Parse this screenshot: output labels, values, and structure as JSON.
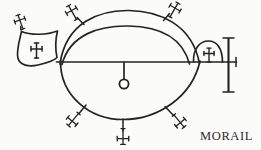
{
  "figure": {
    "caption": "MORAIL",
    "ink_color": "#232323",
    "background_color": "#fbfbf9",
    "parts": {
      "upper_outer_arc": "upper-outer-arc",
      "upper_inner_arc": "upper-inner-arc",
      "lower_arc": "lower-arc",
      "horizontal_beam": "horizontal-beam",
      "pendant_stem": "pendant-stem",
      "pendant_ring": "pendant-ring",
      "left_banner": "left-banner-shield",
      "right_arch": "right-arch",
      "right_mast": "right-mast-bar",
      "right_yard": "right-yard-arm"
    },
    "crosses": [
      {
        "id": "cross-banner-top",
        "position": "banner-top-left",
        "rotation": -20
      },
      {
        "id": "cross-banner-inner",
        "position": "inside-left-banner",
        "rotation": 0
      },
      {
        "id": "cross-upper-left",
        "position": "upper-arc-left",
        "rotation": -30
      },
      {
        "id": "cross-upper-right",
        "position": "upper-arc-right",
        "rotation": 30
      },
      {
        "id": "cross-lower-left",
        "position": "lower-arc-left",
        "rotation": -135
      },
      {
        "id": "cross-lower-center",
        "position": "lower-arc-bottom",
        "rotation": 180
      },
      {
        "id": "cross-lower-right",
        "position": "lower-arc-right",
        "rotation": 135
      },
      {
        "id": "cross-right-arch",
        "position": "inside-right-arch",
        "rotation": 0
      }
    ],
    "counts": {
      "total_crosses": 8,
      "arcs": 3,
      "rings": 1
    }
  }
}
